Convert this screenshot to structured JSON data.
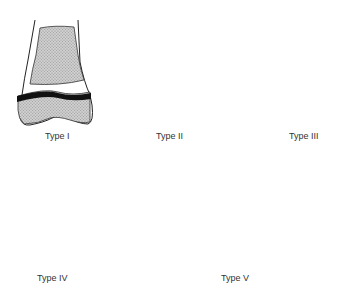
{
  "diagram": {
    "panels": [
      {
        "id": "type-1",
        "label": "Type I"
      },
      {
        "id": "type-2",
        "label": "Type II"
      },
      {
        "id": "type-3",
        "label": "Type III"
      },
      {
        "id": "type-4",
        "label": "Type IV"
      },
      {
        "id": "type-5",
        "label": "Type V"
      }
    ],
    "colors": {
      "bone_fill": "#c8c8c8",
      "physis": "#111111",
      "outline": "#222222",
      "background": "#ffffff"
    }
  }
}
